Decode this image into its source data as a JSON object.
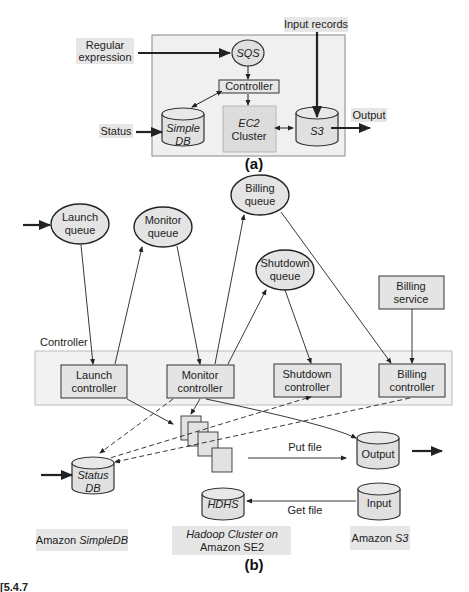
{
  "figure_a": {
    "caption": "(a)",
    "inputs": {
      "regex": [
        "Regular",
        "expression"
      ],
      "input_records": "Input records",
      "status": "Status",
      "output": "Output"
    },
    "nodes": {
      "sqs": "SQS",
      "controller": "Controller",
      "simpledb": [
        "Simple",
        "DB"
      ],
      "ec2": [
        "EC2",
        "Cluster"
      ],
      "s3": "S3"
    }
  },
  "figure_b": {
    "caption": "(b)",
    "queues": {
      "launch": [
        "Launch",
        "queue"
      ],
      "monitor": [
        "Monitor",
        "queue"
      ],
      "billing": [
        "Billing",
        "queue"
      ],
      "shutdown": [
        "Shutdown",
        "queue"
      ]
    },
    "billing_service": [
      "Billing",
      "service"
    ],
    "controller_label": "Controller",
    "controllers": {
      "launch": [
        "Launch",
        "controller"
      ],
      "monitor": [
        "Monitor",
        "controller"
      ],
      "shutdown": [
        "Shutdown",
        "controller"
      ],
      "billing": [
        "Billing",
        "controller"
      ]
    },
    "status_db": [
      "Status",
      "DB"
    ],
    "hdhs": "HDHS",
    "output": "Output",
    "input": "Input",
    "put_file": "Put file",
    "get_file": "Get file",
    "labels": {
      "simpledb": [
        "Amazon ",
        "SimpleDB"
      ],
      "hadoop": [
        "Hadoop Cluster on",
        "Amazon SE2"
      ],
      "s3": [
        "Amazon ",
        "S3"
      ]
    }
  },
  "partial_caption": "[5.4.7"
}
